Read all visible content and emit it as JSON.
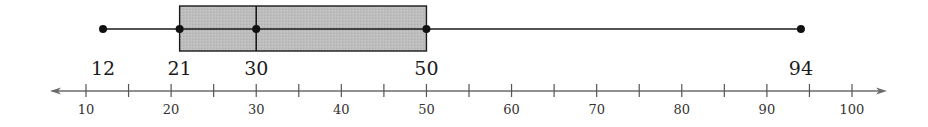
{
  "chart_data": {
    "type": "boxplot",
    "title": "",
    "xlabel": "",
    "ylabel": "",
    "five_number_summary": {
      "min": 12,
      "q1": 21,
      "median": 30,
      "q3": 50,
      "max": 94
    },
    "summary_labels": [
      "12",
      "21",
      "30",
      "50",
      "94"
    ],
    "axis": {
      "min": 10,
      "max": 100,
      "major_ticks": [
        10,
        20,
        30,
        40,
        50,
        60,
        70,
        80,
        90,
        100
      ],
      "minor_ticks": [
        15,
        25,
        35,
        45,
        55,
        65,
        75,
        85,
        95
      ],
      "tick_labels": [
        "10",
        "20",
        "30",
        "40",
        "50",
        "60",
        "70",
        "80",
        "90",
        "100"
      ],
      "arrows_both_ends": true
    },
    "grid": false,
    "legend": null,
    "colors": {
      "box_fill": "#bdbdbd",
      "stroke": "#1a1a1a",
      "axis": "#6b6b6b"
    }
  }
}
